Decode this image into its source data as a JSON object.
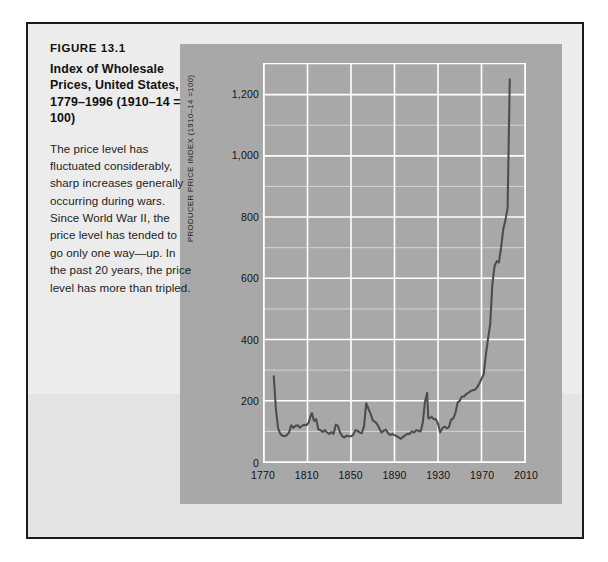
{
  "figure": {
    "number": "FIGURE 13.1",
    "title": "Index of Wholesale Prices, United States, 1779–1996 (1910–14 = 100)",
    "description": "The price level has fluctuated considerably, sharp increases generally occurring during wars. Since World War II, the price level has tended to go only one way—up. In the past 20 years, the price level has more than tripled."
  },
  "colors": {
    "page_background": "#ffffff",
    "panel_background": "#ececec",
    "panel_border": "#1b1b1b",
    "chart_background": "#a8a8a8",
    "grid_line": "#ffffff",
    "series_line": "#4d4d4d",
    "text": "#111111"
  },
  "chart_data": {
    "type": "line",
    "title": "Index of Wholesale Prices, United States, 1779–1996 (1910–14 = 100)",
    "xlabel": "",
    "ylabel": "PRODUCER PRICE INDEX (1910–14 =100)",
    "xlim": [
      1770,
      2010
    ],
    "ylim": [
      0,
      1300
    ],
    "xticks": [
      1770,
      1810,
      1850,
      1890,
      1930,
      1970,
      2010
    ],
    "xtick_labels": [
      "1770",
      "1810",
      "1850",
      "1890",
      "1930",
      "1970",
      "2010"
    ],
    "yticks": [
      0,
      200,
      400,
      600,
      800,
      1000,
      1200
    ],
    "ytick_labels": [
      "0",
      "200",
      "400",
      "600",
      "800",
      "1,000",
      "1,200"
    ],
    "y_minor_step": 100,
    "grid": true,
    "legend": false,
    "series": [
      {
        "name": "Producer price index (1910–14 = 100)",
        "x": [
          1779,
          1781,
          1783,
          1785,
          1787,
          1789,
          1791,
          1793,
          1795,
          1797,
          1799,
          1801,
          1803,
          1805,
          1807,
          1809,
          1811,
          1813,
          1814,
          1816,
          1818,
          1820,
          1822,
          1824,
          1826,
          1828,
          1830,
          1832,
          1834,
          1836,
          1838,
          1840,
          1842,
          1844,
          1846,
          1848,
          1850,
          1852,
          1854,
          1856,
          1858,
          1860,
          1862,
          1864,
          1866,
          1868,
          1870,
          1872,
          1874,
          1876,
          1878,
          1880,
          1882,
          1884,
          1886,
          1888,
          1890,
          1892,
          1894,
          1896,
          1898,
          1900,
          1902,
          1904,
          1906,
          1908,
          1910,
          1912,
          1914,
          1916,
          1918,
          1920,
          1921,
          1922,
          1924,
          1926,
          1928,
          1930,
          1932,
          1934,
          1936,
          1938,
          1940,
          1942,
          1944,
          1946,
          1948,
          1950,
          1952,
          1954,
          1956,
          1958,
          1960,
          1962,
          1964,
          1966,
          1968,
          1970,
          1972,
          1974,
          1976,
          1978,
          1980,
          1982,
          1984,
          1986,
          1988,
          1990,
          1992,
          1994,
          1996
        ],
        "y": [
          280,
          170,
          110,
          92,
          86,
          84,
          88,
          96,
          120,
          112,
          118,
          120,
          112,
          118,
          122,
          120,
          128,
          152,
          160,
          134,
          140,
          106,
          104,
          98,
          104,
          96,
          92,
          98,
          92,
          122,
          118,
          96,
          84,
          80,
          86,
          84,
          84,
          88,
          104,
          102,
          96,
          94,
          118,
          192,
          174,
          158,
          136,
          132,
          124,
          110,
          96,
          102,
          106,
          94,
          88,
          92,
          88,
          84,
          80,
          76,
          82,
          88,
          92,
          92,
          100,
          96,
          104,
          102,
          100,
          128,
          196,
          226,
          144,
          142,
          148,
          140,
          140,
          126,
          96,
          110,
          116,
          110,
          114,
          138,
          142,
          160,
          194,
          200,
          214,
          214,
          222,
          226,
          232,
          234,
          236,
          244,
          256,
          272,
          286,
          350,
          402,
          450,
          582,
          640,
          656,
          652,
          700,
          760,
          790,
          830,
          1250
        ]
      }
    ],
    "annotations": []
  },
  "axis_title_text": "PRODUCER PRICE INDEX (1910–14 =100)"
}
